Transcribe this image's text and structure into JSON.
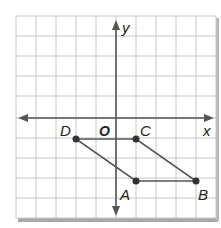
{
  "diagram": {
    "type": "coordinate-plane",
    "grid": {
      "cols": 10,
      "rows": 10,
      "cell": 20,
      "left": 16,
      "top": 16
    },
    "axes": {
      "x_label": "x",
      "y_label": "y",
      "origin_label": "O"
    },
    "colors": {
      "grid": "#c8c8c8",
      "axis": "#555555",
      "shape": "#555555",
      "point": "#333333",
      "shadow": "#9a9a9a"
    },
    "points": [
      {
        "label": "D",
        "x": -2,
        "y": -1
      },
      {
        "label": "C",
        "x": 1,
        "y": -1
      },
      {
        "label": "A",
        "x": 1,
        "y": -3
      },
      {
        "label": "B",
        "x": 4,
        "y": -3
      }
    ],
    "segments": [
      [
        "D",
        "C"
      ],
      [
        "C",
        "B"
      ],
      [
        "B",
        "A"
      ],
      [
        "A",
        "D"
      ]
    ],
    "shape_name": "parallelogram ABCD"
  }
}
